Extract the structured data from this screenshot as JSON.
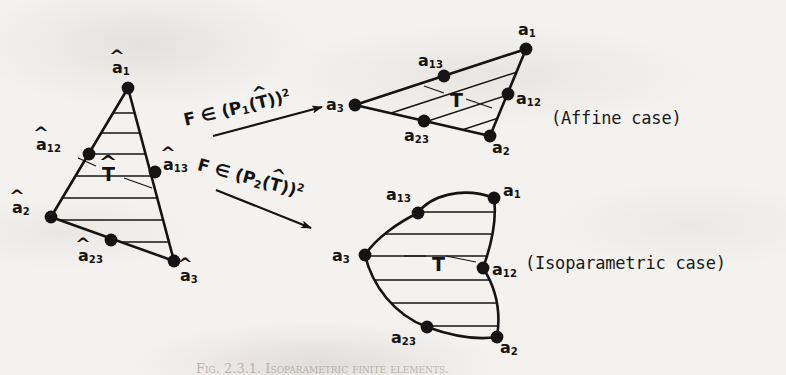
{
  "figure": {
    "background_color": "#f4f2ee",
    "ink_color": "#141414",
    "caption": "Fig. 2.3.1. Isoparametric finite elements."
  },
  "reference_element": {
    "name": "reference-triangle",
    "element_label": "T",
    "element_label_hatted": true,
    "nodes": [
      {
        "id": "a1",
        "label": "a",
        "sub": "1",
        "x": 128,
        "y": 88,
        "label_x": 112,
        "label_y": 60
      },
      {
        "id": "a12",
        "label": "a",
        "sub": "12",
        "x": 89,
        "y": 154,
        "label_x": 36,
        "label_y": 137
      },
      {
        "id": "a13",
        "label": "a",
        "sub": "13",
        "x": 155,
        "y": 172,
        "label_x": 163,
        "label_y": 157
      },
      {
        "id": "a2",
        "label": "a",
        "sub": "2",
        "x": 51,
        "y": 217,
        "label_x": 12,
        "label_y": 200
      },
      {
        "id": "a23",
        "label": "a",
        "sub": "23",
        "x": 111,
        "y": 240,
        "label_x": 78,
        "label_y": 248
      },
      {
        "id": "a3",
        "label": "a",
        "sub": "3",
        "x": 174,
        "y": 261,
        "label_x": 180,
        "label_y": 268
      }
    ],
    "element_label_x": 102,
    "element_label_y": 165
  },
  "affine_element": {
    "name": "affine-triangle",
    "element_label": "T",
    "element_label_hatted": false,
    "case_label": "(Affine case)",
    "case_label_x": 551,
    "case_label_y": 110,
    "nodes": [
      {
        "id": "a1",
        "label": "a",
        "sub": "1",
        "x": 526,
        "y": 49,
        "label_x": 518,
        "label_y": 22
      },
      {
        "id": "a13",
        "label": "a",
        "sub": "13",
        "x": 444,
        "y": 76,
        "label_x": 418,
        "label_y": 53
      },
      {
        "id": "a12",
        "label": "a",
        "sub": "12",
        "x": 508,
        "y": 94,
        "label_x": 516,
        "label_y": 91
      },
      {
        "id": "a3",
        "label": "a",
        "sub": "3",
        "x": 355,
        "y": 105,
        "label_x": 326,
        "label_y": 97
      },
      {
        "id": "a23",
        "label": "a",
        "sub": "23",
        "x": 424,
        "y": 121,
        "label_x": 404,
        "label_y": 128
      },
      {
        "id": "a2",
        "label": "a",
        "sub": "2",
        "x": 490,
        "y": 136,
        "label_x": 492,
        "label_y": 140
      }
    ],
    "element_label_x": 450,
    "element_label_y": 91
  },
  "isoparametric_element": {
    "name": "isoparametric-element",
    "element_label": "T",
    "element_label_hatted": false,
    "case_label": "(Isoparametric case)",
    "case_label_x": 525,
    "case_label_y": 255,
    "nodes": [
      {
        "id": "a1",
        "label": "a",
        "sub": "1",
        "x": 494,
        "y": 198,
        "label_x": 503,
        "label_y": 183
      },
      {
        "id": "a13",
        "label": "a",
        "sub": "13",
        "x": 418,
        "y": 213,
        "label_x": 386,
        "label_y": 187
      },
      {
        "id": "a3",
        "label": "a",
        "sub": "3",
        "x": 365,
        "y": 255,
        "label_x": 332,
        "label_y": 248
      },
      {
        "id": "a12",
        "label": "a",
        "sub": "12",
        "x": 483,
        "y": 268,
        "label_x": 492,
        "label_y": 262
      },
      {
        "id": "a23",
        "label": "a",
        "sub": "23",
        "x": 427,
        "y": 327,
        "label_x": 391,
        "label_y": 330
      },
      {
        "id": "a2",
        "label": "a",
        "sub": "2",
        "x": 497,
        "y": 337,
        "label_x": 500,
        "label_y": 340
      }
    ],
    "element_label_x": 432,
    "element_label_y": 255
  },
  "mappings": [
    {
      "name": "affine-map-arrow",
      "prefix": "F",
      "member_symbol": "∈",
      "space_open": "(P",
      "space_index": "1",
      "space_arg_open": "(",
      "space_arg": "T",
      "space_arg_close": "))",
      "exponent": "2",
      "label_x": 184,
      "label_y": 112,
      "label_rotation": -13,
      "arrow_x1": 213,
      "arrow_y1": 136,
      "arrow_x2": 322,
      "arrow_y2": 107
    },
    {
      "name": "isoparametric-map-arrow",
      "prefix": "F",
      "member_symbol": "∈",
      "space_open": "(P",
      "space_index": "2",
      "space_arg_open": "(",
      "space_arg": "T",
      "space_arg_close": "))",
      "exponent": "2",
      "label_x": 198,
      "label_y": 156,
      "label_rotation": 15,
      "arrow_x1": 216,
      "arrow_y1": 190,
      "arrow_x2": 311,
      "arrow_y2": 228
    }
  ]
}
